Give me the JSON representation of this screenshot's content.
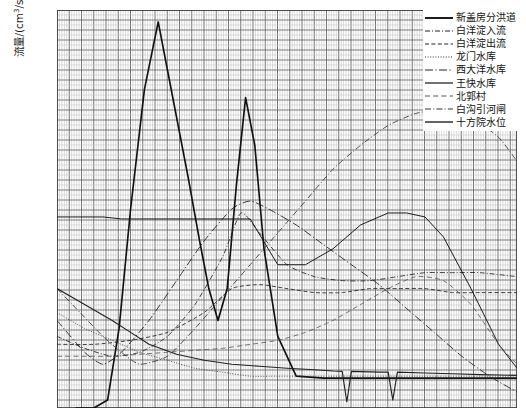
{
  "axis": {
    "ylabel_main": "流量/(cm",
    "ylabel_sup": "3",
    "ylabel_tail": "/s)",
    "ylabel_full": "流量/(cm3/s)"
  },
  "legend": {
    "position": "top-right",
    "items": [
      {
        "label": "新盖房分洪道",
        "style": "solid-thick",
        "color": "#111111"
      },
      {
        "label": "白洋淀入流",
        "style": "dash-dot",
        "color": "#222222"
      },
      {
        "label": "白洋淀出流",
        "style": "dashed",
        "color": "#222222"
      },
      {
        "label": "龙门水库",
        "style": "dotted",
        "color": "#333333"
      },
      {
        "label": "西大洋水库",
        "style": "long-dash-dot",
        "color": "#222222"
      },
      {
        "label": "王快水库",
        "style": "solid-thin",
        "color": "#111111"
      },
      {
        "label": "北郭村",
        "style": "dashed-sparse",
        "color": "#555555"
      },
      {
        "label": "白沟引河闸",
        "style": "dash-dot-2",
        "color": "#333333"
      },
      {
        "label": "十方院水位",
        "style": "solid-medium",
        "color": "#222222"
      }
    ]
  },
  "xticklabels": [
    "",
    "",
    "",
    "",
    "",
    "",
    "",
    "",
    "",
    "",
    "",
    "",
    "",
    "",
    "",
    "",
    "",
    "",
    "",
    ""
  ],
  "chart_data": {
    "type": "line",
    "title": "",
    "xlabel": "",
    "ylabel": "流量/(cm3/s)",
    "grid": "engineering-fine-grid",
    "xlim": [
      0,
      100
    ],
    "ylim": [
      0,
      100
    ],
    "axis_tick_labels_visible": false,
    "note": "Multi-series hydrograph; axis tick labels are cropped off the bottom edge of the screenshot. Values below are read off the plotted curve geometry in normalised 0-100 plot units (x: left-to-right, y: bottom-to-top).",
    "series": [
      {
        "name": "新盖房分洪道",
        "style": "solid-thick",
        "color": "#111111",
        "x": [
          4,
          8,
          11,
          13.5,
          16,
          19,
          22,
          25.5,
          28.5,
          31,
          33,
          35,
          37,
          39,
          41,
          43,
          45,
          48,
          52,
          58,
          66,
          74,
          82,
          90,
          100
        ],
        "y": [
          0,
          0,
          2,
          20,
          50,
          80,
          97,
          76,
          58,
          42,
          30,
          22,
          30,
          56,
          78,
          66,
          40,
          18,
          8,
          7.5,
          7.5,
          7.5,
          7.5,
          7.5,
          7.5
        ]
      },
      {
        "name": "白洋淀入流",
        "style": "dash-dot",
        "color": "#222222",
        "x": [
          0,
          6,
          12,
          18,
          24,
          30,
          36,
          40,
          44,
          50,
          56,
          62,
          68,
          74,
          80,
          86,
          92,
          100
        ],
        "y": [
          18,
          15,
          13,
          14,
          18,
          26,
          38,
          49,
          44,
          36,
          33,
          32,
          32,
          33,
          34,
          34,
          34,
          33
        ]
      },
      {
        "name": "白洋淀出流",
        "style": "dashed",
        "color": "#222222",
        "x": [
          0,
          8,
          16,
          24,
          32,
          38,
          44,
          50,
          56,
          62,
          68,
          74,
          80,
          86,
          92,
          100
        ],
        "y": [
          16,
          16,
          17,
          19,
          24,
          30,
          31,
          30,
          29,
          29,
          30,
          30,
          30,
          29,
          29,
          29
        ]
      },
      {
        "name": "龙门水库",
        "style": "dotted",
        "color": "#333333",
        "x": [
          0,
          6,
          12,
          18,
          24,
          30,
          36,
          42,
          48,
          54,
          60,
          66,
          72,
          78,
          84,
          90,
          96,
          100
        ],
        "y": [
          24,
          20,
          17,
          14,
          12,
          10,
          9,
          8,
          8,
          8,
          8,
          8,
          8,
          8,
          8,
          8,
          8,
          8
        ]
      },
      {
        "name": "西大洋水库",
        "style": "long-dash-dot",
        "color": "#222222",
        "x": [
          0,
          6,
          10,
          14,
          20,
          26,
          32,
          38,
          42,
          46,
          52,
          58,
          64,
          70,
          76,
          82,
          88,
          94,
          100
        ],
        "y": [
          22,
          14,
          11,
          14,
          22,
          32,
          42,
          50,
          52,
          50,
          46,
          41,
          36,
          31,
          25,
          19,
          13,
          8,
          4
        ]
      },
      {
        "name": "王快水库",
        "style": "solid-thin",
        "color": "#111111",
        "x": [
          0,
          5,
          10,
          14,
          18,
          24,
          30,
          36,
          42,
          48,
          54,
          60,
          66,
          72,
          76,
          80,
          84,
          90,
          96,
          100
        ],
        "y": [
          48,
          48,
          48,
          47.5,
          47.5,
          47.5,
          47.5,
          47.5,
          47.5,
          36,
          36,
          40,
          46,
          49,
          49,
          48,
          43,
          30,
          16,
          10
        ]
      },
      {
        "name": "北郭村",
        "style": "dashed-sparse",
        "color": "#555555",
        "x": [
          0,
          6,
          12,
          18,
          24,
          30,
          36,
          42,
          48,
          54,
          60,
          66,
          72,
          78,
          84,
          90,
          96,
          100
        ],
        "y": [
          13,
          13,
          13,
          13.5,
          14,
          14.5,
          15,
          16,
          17,
          19,
          22,
          26,
          30,
          33,
          32,
          26,
          16,
          11
        ]
      },
      {
        "name": "白沟引河闸",
        "style": "dash-dot-2",
        "color": "#333333",
        "x": [
          0,
          5,
          10,
          14,
          18,
          24,
          30,
          36,
          42,
          48,
          54,
          60,
          66,
          72,
          78,
          84,
          90,
          96,
          100
        ],
        "y": [
          30,
          24,
          18,
          14,
          11,
          13,
          20,
          28,
          36,
          44,
          52,
          60,
          66,
          71,
          74,
          75,
          73,
          68,
          62
        ]
      },
      {
        "name": "十方院水位",
        "style": "solid-medium",
        "color": "#222222",
        "x": [
          0,
          6,
          12,
          16,
          20,
          26,
          32,
          38,
          44,
          50,
          56,
          60,
          62,
          63,
          64,
          70,
          72,
          73,
          74,
          80,
          86,
          92,
          100
        ],
        "y": [
          30,
          26,
          22,
          19,
          16,
          13.5,
          12,
          11,
          10.5,
          10,
          9.6,
          9.3,
          9.2,
          1.5,
          9.2,
          9.0,
          9.0,
          2.0,
          9.0,
          8.8,
          8.6,
          8.4,
          8.2
        ]
      }
    ]
  }
}
